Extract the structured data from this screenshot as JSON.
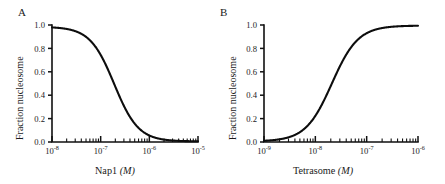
{
  "figure": {
    "background": "#ffffff",
    "curve_color": "#0d0d0d",
    "axis_color": "#111111"
  },
  "panels": [
    {
      "letter": "A",
      "xlabel_text": "Nap1 ",
      "xlabel_unit": "(M)",
      "ylabel": "Fraction nucleosome",
      "xticks": [
        "10-8",
        "10-7",
        "10-6",
        "10-5"
      ],
      "xtick_mantissa": "10",
      "xtick_exponents": [
        "-8",
        "-7",
        "-6",
        "-5"
      ],
      "yticks": [
        "1.0",
        "0.8",
        "0.6",
        "0.4",
        "0.2",
        "0.0"
      ]
    },
    {
      "letter": "B",
      "xlabel_text": "Tetrasome ",
      "xlabel_unit": "(M)",
      "ylabel": "Fraction nucleosome",
      "xticks": [
        "10-9",
        "10-8",
        "10-7",
        "10-6"
      ],
      "xtick_mantissa": "10",
      "xtick_exponents": [
        "-9",
        "-8",
        "-7",
        "-6"
      ],
      "yticks": [
        "1.0",
        "0.8",
        "0.6",
        "0.4",
        "0.2",
        "0.0"
      ]
    }
  ],
  "chart_data": [
    {
      "type": "line",
      "panel": "A",
      "title": "",
      "xlabel": "Nap1 (M)",
      "ylabel": "Fraction nucleosome",
      "xscale": "log",
      "xlim": [
        1e-08,
        1e-05
      ],
      "ylim": [
        0.0,
        1.0
      ],
      "xtick_labels": [
        "10^-8",
        "10^-7",
        "10^-6",
        "10^-5"
      ],
      "ytick_labels": [
        "0.0",
        "0.2",
        "0.4",
        "0.6",
        "0.8",
        "1.0"
      ],
      "grid": false,
      "legend": "none",
      "series": [
        {
          "name": "Fraction nucleosome vs Nap1",
          "shape": "decreasing sigmoid",
          "midpoint_x": 1.9e-07,
          "hill_slope": 1.75,
          "top": 0.985,
          "bottom": 0.005,
          "x": [
            1e-08,
            1.8e-08,
            3.2e-08,
            5.6e-08,
            1e-07,
            1.4e-07,
            1.9e-07,
            2.6e-07,
            3.6e-07,
            5.6e-07,
            1e-06,
            1.8e-06,
            3.2e-06,
            1e-05
          ],
          "y": [
            0.985,
            0.975,
            0.955,
            0.9,
            0.76,
            0.63,
            0.5,
            0.36,
            0.24,
            0.13,
            0.05,
            0.02,
            0.01,
            0.003
          ]
        }
      ]
    },
    {
      "type": "line",
      "panel": "B",
      "title": "",
      "xlabel": "Tetrasome (M)",
      "ylabel": "Fraction nucleosome",
      "xscale": "log",
      "xlim": [
        1e-09,
        1e-06
      ],
      "ylim": [
        0.0,
        1.0
      ],
      "xtick_labels": [
        "10^-9",
        "10^-8",
        "10^-7",
        "10^-6"
      ],
      "ytick_labels": [
        "0.0",
        "0.2",
        "0.4",
        "0.6",
        "0.8",
        "1.0"
      ],
      "grid": false,
      "legend": "none",
      "series": [
        {
          "name": "Fraction nucleosome vs Tetrasome",
          "shape": "increasing sigmoid",
          "midpoint_x": 2.1e-08,
          "hill_slope": 1.7,
          "top": 0.995,
          "bottom": 0.005,
          "x": [
            1e-09,
            2e-09,
            4e-09,
            7e-09,
            1e-08,
            1.5e-08,
            2.1e-08,
            3e-08,
            4.5e-08,
            7e-08,
            1.2e-07,
            2.5e-07,
            5e-07,
            1e-06
          ],
          "y": [
            0.005,
            0.01,
            0.025,
            0.065,
            0.13,
            0.3,
            0.5,
            0.68,
            0.83,
            0.92,
            0.97,
            0.99,
            0.995,
            0.995
          ]
        }
      ]
    }
  ]
}
